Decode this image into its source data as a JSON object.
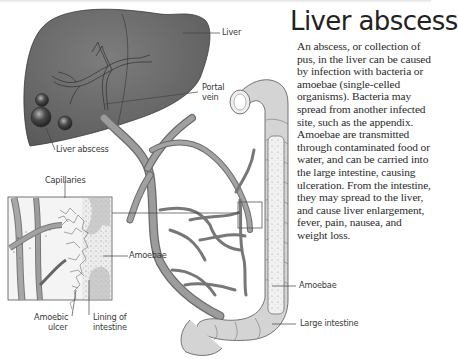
{
  "title": "Liver abscess",
  "description": "An abscess, or collection of pus, in the liver can be caused by infection with bacteria or amoebae (single-celled organisms). Bacteria may spread from another infected site, such as the appendix. Amoebae are transmitted through contaminated food or water, and can be carried into the large intestine, causing ulceration. From the intestine, they may spread to the liver, and cause liver enlargement, fever, pain, nausea, and weight loss.",
  "labels": {
    "liver": "Liver",
    "portal_vein_1": "Portal",
    "portal_vein_2": "vein",
    "liver_abscess": "Liver abscess",
    "capillaries": "Capillaries",
    "amoebae_inset": "Amoebae",
    "amoebic_ulcer_1": "Amoebic",
    "amoebic_ulcer_2": "ulcer",
    "lining_1": "Lining of",
    "lining_2": "intestine",
    "amoebae_intestine": "Amoebae",
    "large_intestine": "Large intestine"
  },
  "colors": {
    "liver": "#6e6e6e",
    "vessel": "#8a8a8a",
    "intestine": "#cfcfcf",
    "text": "#2a2a2a"
  }
}
